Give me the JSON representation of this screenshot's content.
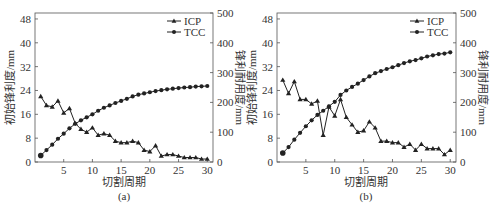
{
  "figure": {
    "panels": [
      {
        "id": "a",
        "caption": "(a)"
      },
      {
        "id": "b",
        "caption": "(b)"
      }
    ]
  },
  "chart_data": [
    {
      "type": "line",
      "panel": "(a)",
      "title": "",
      "xlabel": "切割周期",
      "ylabel": "初始锋利度/mm",
      "y2label": "锋利耐用度/mm",
      "xlim": [
        0,
        31
      ],
      "ylim": [
        0,
        50
      ],
      "y2lim": [
        0,
        500
      ],
      "xticks": [
        5,
        10,
        15,
        20,
        25,
        30
      ],
      "yticks": [
        0,
        8,
        16,
        24,
        32,
        40,
        48
      ],
      "y2ticks": [
        0,
        100,
        200,
        300,
        400,
        500
      ],
      "grid": false,
      "legend_position": "upper right",
      "x": [
        1,
        2,
        3,
        4,
        5,
        6,
        7,
        8,
        9,
        10,
        11,
        12,
        13,
        14,
        15,
        16,
        17,
        18,
        19,
        20,
        21,
        22,
        23,
        24,
        25,
        26,
        27,
        28,
        29,
        30
      ],
      "series": [
        {
          "name": "ICP",
          "axis": "left",
          "marker": "triangle",
          "values": [
            22,
            19,
            18.5,
            20.5,
            16.5,
            18,
            13,
            11,
            10,
            11.5,
            9,
            9.5,
            9,
            7,
            6.5,
            6.5,
            7,
            6.5,
            4,
            3.5,
            5.5,
            2,
            2.5,
            2.5,
            2,
            1.5,
            1.5,
            1.5,
            1,
            1
          ]
        },
        {
          "name": "TCC",
          "axis": "right",
          "marker": "circle",
          "values": [
            22,
            40,
            58,
            78,
            95,
            113,
            128,
            140,
            150,
            160,
            172,
            182,
            190,
            198,
            205,
            212,
            220,
            226,
            230,
            234,
            238,
            241,
            244,
            246,
            248,
            250,
            251,
            253,
            254,
            255
          ]
        }
      ]
    },
    {
      "type": "line",
      "panel": "(b)",
      "title": "",
      "xlabel": "切割周期",
      "ylabel": "初始锋利度/mm",
      "y2label": "锋利耐用度/mm",
      "xlim": [
        0,
        31
      ],
      "ylim": [
        0,
        50
      ],
      "y2lim": [
        0,
        500
      ],
      "xticks": [
        5,
        10,
        15,
        20,
        25,
        30
      ],
      "yticks": [
        0,
        8,
        16,
        24,
        32,
        40,
        48
      ],
      "y2ticks": [
        0,
        100,
        200,
        300,
        400,
        500
      ],
      "grid": false,
      "legend_position": "upper right",
      "x": [
        1,
        2,
        3,
        4,
        5,
        6,
        7,
        8,
        9,
        10,
        11,
        12,
        13,
        14,
        15,
        16,
        17,
        18,
        19,
        20,
        21,
        22,
        23,
        24,
        25,
        26,
        27,
        28,
        29,
        30
      ],
      "series": [
        {
          "name": "ICP",
          "axis": "left",
          "marker": "triangle",
          "values": [
            27.5,
            23,
            27,
            21,
            21,
            19.5,
            20.5,
            9,
            18.5,
            15.5,
            21,
            15,
            12.5,
            10,
            10.5,
            13.5,
            11.5,
            7,
            7,
            6.5,
            6.5,
            5,
            6,
            4,
            6,
            4.5,
            4.5,
            4.5,
            2.5,
            4
          ]
        },
        {
          "name": "TCC",
          "axis": "right",
          "marker": "circle",
          "values": [
            30,
            50,
            75,
            98,
            120,
            140,
            158,
            172,
            187,
            202,
            225,
            240,
            252,
            263,
            275,
            287,
            298,
            305,
            312,
            318,
            325,
            332,
            338,
            342,
            348,
            354,
            358,
            362,
            364,
            368
          ]
        }
      ]
    }
  ]
}
